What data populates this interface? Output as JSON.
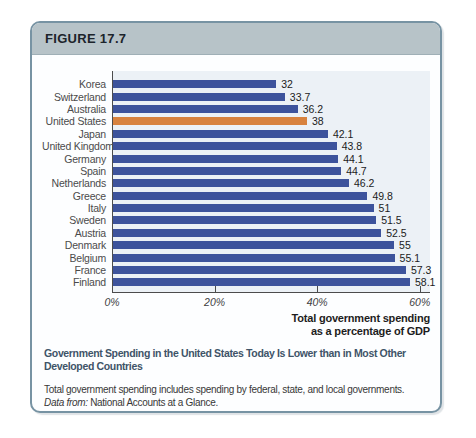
{
  "figure": {
    "label": "FIGURE 17.7"
  },
  "chart_data": {
    "type": "bar",
    "orientation": "horizontal",
    "categories": [
      "Korea",
      "Switzerland",
      "Australia",
      "United States",
      "Japan",
      "United Kingdom",
      "Germany",
      "Spain",
      "Netherlands",
      "Greece",
      "Italy",
      "Sweden",
      "Austria",
      "Denmark",
      "Belgium",
      "France",
      "Finland"
    ],
    "values": [
      32,
      33.7,
      36.2,
      38,
      42.1,
      43.8,
      44.1,
      44.7,
      46.2,
      49.8,
      51,
      51.5,
      52.5,
      55,
      55.1,
      57.3,
      58.1
    ],
    "value_labels": [
      "32",
      "33.7",
      "36.2",
      "38",
      "42.1",
      "43.8",
      "44.1",
      "44.7",
      "46.2",
      "49.8",
      "51",
      "51.5",
      "52.5",
      "55",
      "55.1",
      "57.3",
      "58.1"
    ],
    "highlight_category": "United States",
    "highlight_index": 3,
    "bar_color": "#3d539c",
    "highlight_color": "#d8823e",
    "xlim": [
      0,
      62
    ],
    "x_ticks": [
      {
        "value": 0,
        "label": "0%"
      },
      {
        "value": 20,
        "label": "20%"
      },
      {
        "value": 40,
        "label": "40%"
      },
      {
        "value": 60,
        "label": "60%"
      }
    ],
    "grid": false,
    "legend": "none",
    "xlabel": "Total government spending as a percentage of GDP",
    "xlabel_lines": [
      "Total government spending",
      "as a percentage of GDP"
    ]
  },
  "caption": {
    "title": "Government Spending in the United States Today Is Lower than in Most Other Developed Countries",
    "note": "Total government spending includes spending by federal, state, and local governments.",
    "source_label": "Data from:",
    "source_text": "National Accounts at a Glance."
  }
}
